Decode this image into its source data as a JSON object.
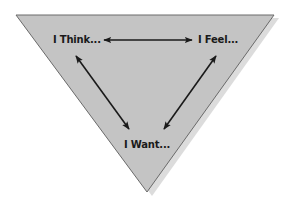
{
  "diagram": {
    "type": "inverted-triangle",
    "colors": {
      "triangle_fill": "#c4c4c4",
      "triangle_stroke": "#6a6a6a",
      "shadow": "#dcdcdc",
      "arrow": "#1a1a1a",
      "text": "#1a1a1a"
    },
    "nodes": [
      {
        "id": "think",
        "label": "I Think..."
      },
      {
        "id": "feel",
        "label": "I Feel..."
      },
      {
        "id": "want",
        "label": "I Want..."
      }
    ],
    "edges": [
      {
        "from": "think",
        "to": "feel",
        "style": "double-arrow"
      },
      {
        "from": "think",
        "to": "want",
        "style": "double-arrow"
      },
      {
        "from": "feel",
        "to": "want",
        "style": "double-arrow"
      }
    ]
  }
}
